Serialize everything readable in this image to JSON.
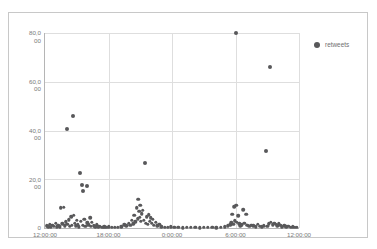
{
  "chart_data": {
    "type": "scatter",
    "title": "",
    "xlabel": "",
    "ylabel": "",
    "grid": true,
    "legend_position": "top-right",
    "legend": [
      {
        "name": "retweets",
        "color": "#58585a",
        "marker": "circle"
      }
    ],
    "ylim": [
      0,
      80000
    ],
    "yticks": [
      0,
      20000,
      40000,
      60000,
      80000
    ],
    "ytick_labels": [
      {
        "line1": "0",
        "line2": ""
      },
      {
        "line1": "20,0",
        "line2": "00"
      },
      {
        "line1": "40,0",
        "line2": "00"
      },
      {
        "line1": "60,0",
        "line2": "00"
      },
      {
        "line1": "80,0",
        "line2": "00"
      }
    ],
    "xlim": [
      0,
      24
    ],
    "xticks": [
      0,
      6,
      12,
      18,
      24
    ],
    "xtick_labels": [
      "12:00:00",
      "18:00:00",
      "0:00:00",
      "6:00:00",
      "12:00:00"
    ],
    "series": [
      {
        "name": "retweets",
        "color": "#58585a",
        "points": [
          [
            0.15,
            900
          ],
          [
            0.3,
            600
          ],
          [
            0.45,
            1500
          ],
          [
            0.55,
            400
          ],
          [
            0.7,
            1200
          ],
          [
            0.85,
            700
          ],
          [
            1.0,
            2100
          ],
          [
            1.1,
            500
          ],
          [
            1.25,
            1000
          ],
          [
            1.4,
            600
          ],
          [
            1.5,
            8400
          ],
          [
            1.62,
            1800
          ],
          [
            1.75,
            8500
          ],
          [
            1.85,
            900
          ],
          [
            1.95,
            2600
          ],
          [
            2.05,
            40800
          ],
          [
            2.1,
            1500
          ],
          [
            2.25,
            3400
          ],
          [
            2.35,
            700
          ],
          [
            2.45,
            4600
          ],
          [
            2.55,
            1100
          ],
          [
            2.6,
            45800
          ],
          [
            2.7,
            5200
          ],
          [
            2.8,
            2000
          ],
          [
            2.9,
            900
          ],
          [
            3.0,
            3100
          ],
          [
            3.1,
            1400
          ],
          [
            3.2,
            600
          ],
          [
            3.35,
            22500
          ],
          [
            3.4,
            2700
          ],
          [
            3.5,
            17600
          ],
          [
            3.55,
            1200
          ],
          [
            3.6,
            15200
          ],
          [
            3.7,
            3500
          ],
          [
            3.8,
            800
          ],
          [
            3.95,
            17200
          ],
          [
            4.0,
            2200
          ],
          [
            4.1,
            1300
          ],
          [
            4.25,
            4100
          ],
          [
            4.35,
            700
          ],
          [
            4.45,
            2500
          ],
          [
            4.6,
            1000
          ],
          [
            4.75,
            600
          ],
          [
            4.9,
            1400
          ],
          [
            5.05,
            500
          ],
          [
            5.2,
            800
          ],
          [
            5.4,
            400
          ],
          [
            5.6,
            600
          ],
          [
            5.8,
            300
          ],
          [
            6.0,
            500
          ],
          [
            6.3,
            300
          ],
          [
            6.6,
            400
          ],
          [
            6.9,
            250
          ],
          [
            7.2,
            600
          ],
          [
            7.5,
            1400
          ],
          [
            7.7,
            900
          ],
          [
            7.9,
            2000
          ],
          [
            8.05,
            1200
          ],
          [
            8.2,
            3100
          ],
          [
            8.35,
            1800
          ],
          [
            8.45,
            5300
          ],
          [
            8.55,
            2600
          ],
          [
            8.65,
            8200
          ],
          [
            8.75,
            3900
          ],
          [
            8.8,
            11700
          ],
          [
            8.9,
            6800
          ],
          [
            8.95,
            4400
          ],
          [
            9.0,
            9300
          ],
          [
            9.05,
            2900
          ],
          [
            9.15,
            5900
          ],
          [
            9.25,
            7200
          ],
          [
            9.35,
            3300
          ],
          [
            9.45,
            26600
          ],
          [
            9.5,
            2100
          ],
          [
            9.6,
            4700
          ],
          [
            9.7,
            1600
          ],
          [
            9.8,
            5500
          ],
          [
            9.9,
            2800
          ],
          [
            10.0,
            4200
          ],
          [
            10.1,
            1900
          ],
          [
            10.2,
            3600
          ],
          [
            10.3,
            1100
          ],
          [
            10.45,
            2300
          ],
          [
            10.6,
            900
          ],
          [
            10.8,
            1500
          ],
          [
            11.0,
            600
          ],
          [
            11.3,
            400
          ],
          [
            11.6,
            300
          ],
          [
            11.9,
            500
          ],
          [
            12.2,
            250
          ],
          [
            12.6,
            400
          ],
          [
            13.0,
            200
          ],
          [
            13.4,
            350
          ],
          [
            13.8,
            250
          ],
          [
            14.2,
            300
          ],
          [
            14.6,
            200
          ],
          [
            15.0,
            400
          ],
          [
            15.4,
            250
          ],
          [
            15.8,
            300
          ],
          [
            16.2,
            200
          ],
          [
            16.6,
            350
          ],
          [
            17.0,
            500
          ],
          [
            17.3,
            900
          ],
          [
            17.5,
            1300
          ],
          [
            17.6,
            2200
          ],
          [
            17.7,
            5700
          ],
          [
            17.8,
            1500
          ],
          [
            17.9,
            8600
          ],
          [
            17.95,
            3000
          ],
          [
            18.0,
            79900
          ],
          [
            18.05,
            9300
          ],
          [
            18.15,
            2500
          ],
          [
            18.25,
            5100
          ],
          [
            18.35,
            1800
          ],
          [
            18.45,
            900
          ],
          [
            18.6,
            1400
          ],
          [
            18.75,
            7400
          ],
          [
            18.85,
            2000
          ],
          [
            19.0,
            5600
          ],
          [
            19.1,
            1100
          ],
          [
            19.3,
            700
          ],
          [
            19.5,
            1200
          ],
          [
            19.7,
            900
          ],
          [
            19.9,
            600
          ],
          [
            20.1,
            1500
          ],
          [
            20.3,
            800
          ],
          [
            20.5,
            500
          ],
          [
            20.7,
            900
          ],
          [
            20.9,
            31500
          ],
          [
            21.0,
            700
          ],
          [
            21.15,
            1800
          ],
          [
            21.25,
            66200
          ],
          [
            21.35,
            2400
          ],
          [
            21.5,
            1300
          ],
          [
            21.65,
            2000
          ],
          [
            21.8,
            1500
          ],
          [
            21.95,
            900
          ],
          [
            22.1,
            1700
          ],
          [
            22.25,
            1100
          ],
          [
            22.4,
            600
          ],
          [
            22.6,
            900
          ],
          [
            22.8,
            500
          ],
          [
            23.0,
            700
          ],
          [
            23.2,
            400
          ],
          [
            23.4,
            600
          ],
          [
            23.6,
            300
          ],
          [
            23.8,
            450
          ]
        ]
      }
    ]
  }
}
